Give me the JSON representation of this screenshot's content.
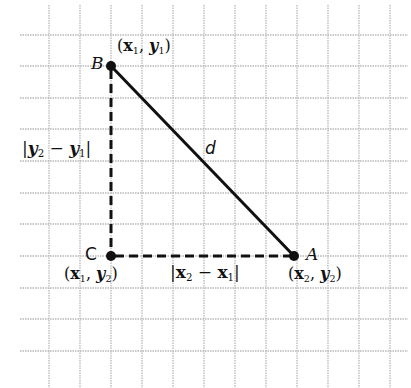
{
  "diagram": {
    "type": "distance-formula-grid",
    "grid": {
      "x_lines": [
        49,
        80,
        111,
        142,
        173,
        204,
        235,
        266,
        297,
        328,
        359,
        390
      ],
      "y_lines": [
        35,
        66,
        98,
        129,
        161,
        193,
        224,
        256,
        288,
        319,
        351
      ],
      "x_start": 20,
      "x_end": 408,
      "y_start": 5,
      "y_end": 388,
      "color": "#b8b8b8"
    },
    "points": {
      "B": {
        "label": "B",
        "coord_label": "(x1, y1)",
        "x": 111,
        "y": 66
      },
      "C": {
        "label": "C",
        "coord_label": "(x1, y2)",
        "x": 111,
        "y": 256
      },
      "A": {
        "label": "A",
        "coord_label": "(x2, y2)",
        "x": 294,
        "y": 256
      }
    },
    "segments": {
      "BA": {
        "label": "d",
        "style": "solid"
      },
      "BC": {
        "label": "|y2 − y1|",
        "style": "dashed"
      },
      "CA": {
        "label": "|x2 − x1|",
        "style": "dashed"
      }
    },
    "labels": {
      "B": "B",
      "C": "C",
      "A": "A",
      "d": "d",
      "x": "x",
      "y": "y",
      "sub1": "1",
      "sub2": "2",
      "minus": "−",
      "comma": ",",
      "lparen": "(",
      "rparen": ")",
      "bar": "|"
    }
  }
}
